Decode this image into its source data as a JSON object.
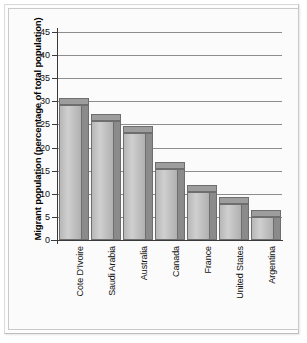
{
  "chart_data": {
    "type": "bar",
    "title": "",
    "xlabel": "",
    "ylabel": "Migrant population (percentage of total population)",
    "ylim": [
      0,
      45
    ],
    "ytick_labels": [
      "45",
      "40",
      "35",
      "30",
      "25",
      "20",
      "15",
      "10",
      "5",
      "0"
    ],
    "ytick_values": [
      45,
      40,
      35,
      30,
      25,
      20,
      15,
      10,
      5,
      0
    ],
    "grid": true,
    "legend": "none",
    "categories": [
      "Cote D'Ivoire",
      "Saudi Arabia",
      "Australia",
      "Canada",
      "France",
      "United States",
      "Argentina"
    ],
    "values": [
      29.3,
      25.7,
      23.2,
      15.4,
      10.3,
      7.8,
      5.0
    ],
    "bar_style": "3d-shaded-gray"
  },
  "colors": {
    "bar_face_light": "#cfcfcf",
    "bar_face_dark": "#b0b0b0",
    "bar_side": "#8b8b8b",
    "bar_outline": "#6e6e6e",
    "gridline": "#8d8d8d",
    "axis": "#3a3a3a",
    "text": "#111111",
    "background": "#fbfbfb"
  }
}
